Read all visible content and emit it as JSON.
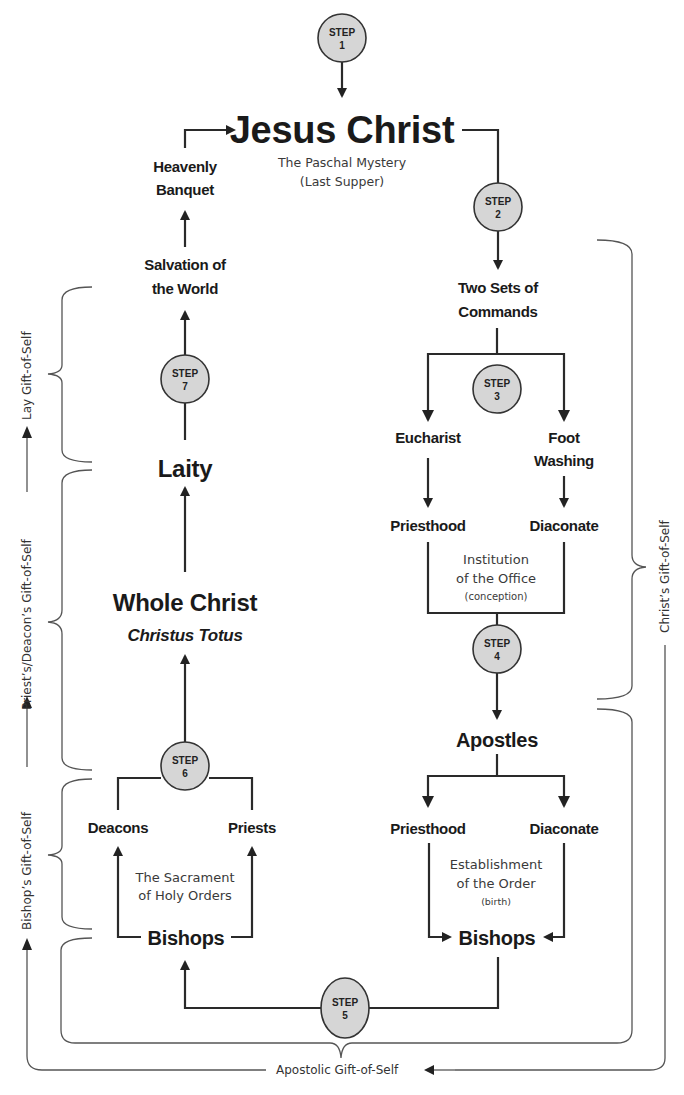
{
  "steps": [
    {
      "label": "STEP",
      "num": "1"
    },
    {
      "label": "STEP",
      "num": "2"
    },
    {
      "label": "STEP",
      "num": "3"
    },
    {
      "label": "STEP",
      "num": "4"
    },
    {
      "label": "STEP",
      "num": "5"
    },
    {
      "label": "STEP",
      "num": "6"
    },
    {
      "label": "STEP",
      "num": "7"
    }
  ],
  "top": {
    "title": "Jesus Christ",
    "subtitle_1": "The Paschal Mystery",
    "subtitle_2": "(Last Supper)"
  },
  "left_column": {
    "heavenly_1": "Heavenly",
    "heavenly_2": "Banquet",
    "salvation_1": "Salvation of",
    "salvation_2": "the World",
    "laity": "Laity",
    "whole_christ": "Whole Christ",
    "christus_totus": "Christus Totus",
    "deacons": "Deacons",
    "priests": "Priests",
    "sacrament_1": "The Sacrament",
    "sacrament_2": "of Holy Orders",
    "bishops": "Bishops"
  },
  "right_column": {
    "commands_1": "Two Sets of",
    "commands_2": "Commands",
    "eucharist": "Eucharist",
    "foot_1": "Foot",
    "foot_2": "Washing",
    "priesthood": "Priesthood",
    "diaconate": "Diaconate",
    "institution_1": "Institution",
    "institution_2": "of the Office",
    "institution_3": "(conception)",
    "apostles": "Apostles",
    "priesthood_2": "Priesthood",
    "diaconate_2": "Diaconate",
    "establishment_1": "Establishment",
    "establishment_2": "of the Order",
    "establishment_3": "(birth)",
    "bishops": "Bishops"
  },
  "side_labels": {
    "lay": "Lay Gift-of-Self",
    "priest_deacon": "Priest’s/Deacon’s Gift-of-Self",
    "bishop": "Bishop’s Gift-of-Self",
    "christ": "Christ’s Gift-of-Self",
    "apostolic": "Apostolic Gift-of-Self"
  },
  "colors": {
    "step_fill": "#d6d6d6",
    "line": "#2a2a2a",
    "bracket": "#555555"
  }
}
